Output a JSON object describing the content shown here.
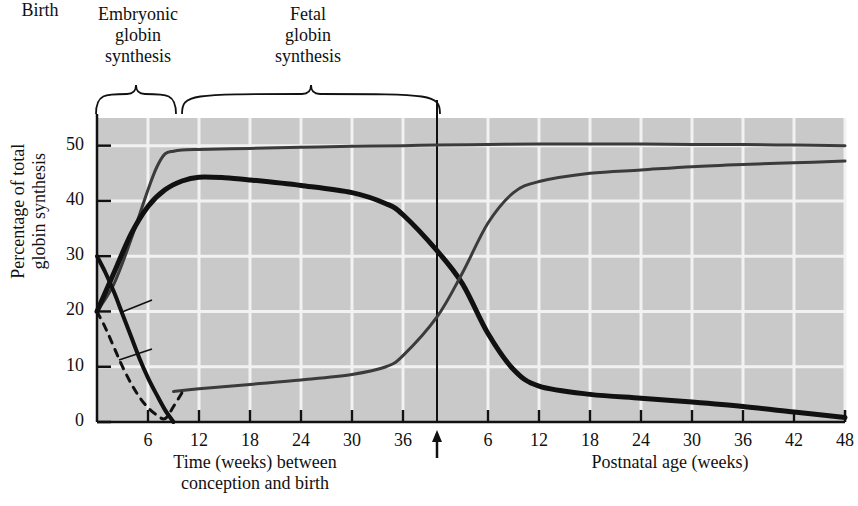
{
  "figure": {
    "phases": [
      {
        "name": "embryonic",
        "label": "Embryonic\nglobin\nsynthesis"
      },
      {
        "name": "fetal",
        "label": "Fetal\nglobin\nsynthesis"
      }
    ],
    "birth_marker_label": "Birth"
  },
  "chart_data": {
    "type": "line",
    "title": "",
    "ylabel": "Percentage of total\nglobin synthesis",
    "xlabel_prenatal": "Time (weeks) between\nconception and birth",
    "xlabel_postnatal": "Postnatal age (weeks)",
    "ylim": [
      0,
      55
    ],
    "yticks": [
      0,
      10,
      20,
      30,
      40,
      50
    ],
    "ytick_labels": [
      "0",
      "10",
      "20",
      "30",
      "40",
      "50"
    ],
    "grid": true,
    "legend_position": "inline-annotations",
    "x_axis": {
      "prenatal_ticks": [
        6,
        12,
        18,
        24,
        30,
        36
      ],
      "prenatal_tick_labels": [
        "6",
        "12",
        "18",
        "24",
        "30",
        "36"
      ],
      "birth_at_weeks": 40,
      "postnatal_ticks": [
        6,
        12,
        18,
        24,
        30,
        36,
        42,
        48
      ],
      "postnatal_tick_labels": [
        "6",
        "12",
        "18",
        "24",
        "30",
        "36",
        "42",
        "48"
      ]
    },
    "series": [
      {
        "name": "alpha-globin",
        "label": "α-Globin",
        "color": "#3b3b3b",
        "style": "solid",
        "width": 3,
        "x": [
          0,
          2,
          4,
          6,
          7,
          8,
          9,
          10,
          12,
          18,
          24,
          30,
          36,
          40,
          46,
          52,
          58,
          64,
          70,
          76,
          82,
          88
        ],
        "values": [
          20,
          25,
          33,
          42,
          46,
          48.5,
          49,
          49.2,
          49.3,
          49.5,
          49.7,
          49.9,
          50,
          50.1,
          50.2,
          50.3,
          50.3,
          50.3,
          50.2,
          50.2,
          50.1,
          50
        ]
      },
      {
        "name": "gamma-globin",
        "label": "γ-Globin",
        "color": "#111111",
        "style": "solid",
        "width": 5,
        "x": [
          0,
          2,
          4,
          6,
          8,
          10,
          12,
          15,
          18,
          24,
          30,
          34,
          36,
          40,
          43,
          46,
          49,
          52,
          58,
          64,
          70,
          76,
          82,
          88
        ],
        "values": [
          20,
          27,
          34,
          39,
          42,
          43.6,
          44.3,
          44.2,
          43.8,
          42.8,
          41.5,
          39.5,
          37.5,
          31,
          25,
          16,
          9.5,
          6.5,
          5,
          4.3,
          3.6,
          2.8,
          1.8,
          0.8
        ]
      },
      {
        "name": "beta-globin",
        "label": "β-Globin",
        "color": "#3b3b3b",
        "style": "solid",
        "width": 3,
        "x": [
          9,
          12,
          18,
          24,
          30,
          34,
          36,
          40,
          43,
          46,
          49,
          52,
          58,
          64,
          70,
          76,
          82,
          88
        ],
        "values": [
          5.5,
          6,
          6.8,
          7.6,
          8.6,
          10,
          12,
          19,
          27,
          36,
          41.5,
          43.5,
          45,
          45.6,
          46.2,
          46.6,
          46.9,
          47.2
        ]
      },
      {
        "name": "epsilon-globin",
        "label": "ε-Globin",
        "color": "#111111",
        "style": "solid",
        "width": 4,
        "x": [
          0,
          1,
          2,
          3,
          4,
          5,
          6,
          7,
          8,
          9
        ],
        "values": [
          30,
          27,
          23.5,
          19.5,
          15.5,
          11.5,
          8,
          5,
          2.2,
          0
        ]
      },
      {
        "name": "zeta-globin",
        "label": "ζ-Globin",
        "color": "#111111",
        "style": "dashed",
        "width": 3,
        "x": [
          0,
          1,
          2,
          3,
          4,
          5,
          6,
          7,
          8,
          9,
          10
        ],
        "values": [
          20,
          17,
          13.5,
          10,
          7,
          4.5,
          2.6,
          1.3,
          0.6,
          2.8,
          5.3
        ]
      }
    ],
    "annotations": [
      {
        "name": "alpha-label",
        "text": "α-Globin",
        "x_px": 562,
        "y_px": 126
      },
      {
        "name": "beta-label",
        "text": "β-Globin",
        "x_px": 570,
        "y_px": 183
      },
      {
        "name": "gamma-label",
        "text": "γ-Globin",
        "x_px": 566,
        "y_px": 366
      },
      {
        "name": "epsilon-label",
        "text": "ε-Globin",
        "x_px": 158,
        "y_px": 295
      },
      {
        "name": "zeta-label",
        "text": "ζ-Globin",
        "x_px": 158,
        "y_px": 344
      }
    ]
  }
}
